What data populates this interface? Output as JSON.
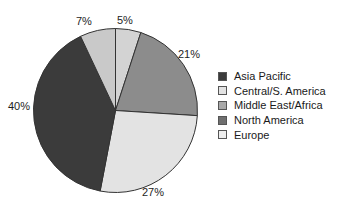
{
  "chart_data": {
    "type": "pie",
    "title": "",
    "xlabel": "",
    "ylabel": "",
    "legend_position": "right",
    "grid": false,
    "categories": [
      "Europe",
      "Middle East/Africa",
      "Central/S. America",
      "Asia Pacific",
      "North America"
    ],
    "values": [
      5,
      21,
      27,
      40,
      7
    ],
    "labels": [
      "5%",
      "21%",
      "27%",
      "40%",
      "7%"
    ],
    "slices": [
      {
        "name": "Europe",
        "value": 5,
        "label": "5%",
        "color": "#d3d3d3",
        "start_deg": 0,
        "end_deg": 18
      },
      {
        "name": "Middle East/Africa",
        "value": 21,
        "label": "21%",
        "color": "#8c8c8c",
        "start_deg": 18,
        "end_deg": 93.6
      },
      {
        "name": "Central/S. America",
        "value": 27,
        "label": "27%",
        "color": "#e3e3e3",
        "start_deg": 93.6,
        "end_deg": 190.8
      },
      {
        "name": "Asia Pacific",
        "value": 40,
        "label": "40%",
        "color": "#3b3b3b",
        "start_deg": 190.8,
        "end_deg": 334.8
      },
      {
        "name": "North America",
        "value": 7,
        "label": "7%",
        "color": "#c9c9c9",
        "start_deg": 334.8,
        "end_deg": 360
      }
    ],
    "legend": [
      {
        "label": "Asia Pacific",
        "color": "#3b3b3b"
      },
      {
        "label": "Central/S. America",
        "color": "#e3e3e3"
      },
      {
        "label": "Middle East/Africa",
        "color": "#a8a8a8"
      },
      {
        "label": "North America",
        "color": "#6f6f6f"
      },
      {
        "label": "Europe",
        "color": "#ededed"
      }
    ],
    "outline_color": "#333333",
    "background": "#ffffff"
  },
  "pct_labels": {
    "seven": "7%",
    "five": "5%",
    "twentyone": "21%",
    "twentyseven": "27%",
    "forty": "40%"
  }
}
